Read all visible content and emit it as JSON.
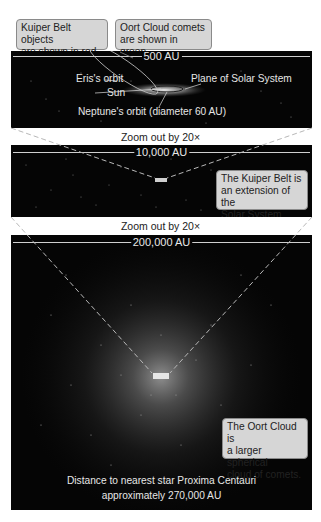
{
  "legend": {
    "kuiper_note": [
      "Kuiper Belt objects",
      "are shown in red."
    ],
    "oort_note": [
      "Oort Cloud comets",
      "are shown in green."
    ]
  },
  "panel1": {
    "scale_label": "500 AU",
    "labels": {
      "eris": "Eris's orbit",
      "plane": "Plane of Solar System",
      "sun": "Sun",
      "neptune": "Neptune's orbit (diameter 60 AU)"
    }
  },
  "zoom_step_1": "Zoom out by 20×",
  "panel2": {
    "scale_label": "10,000 AU",
    "callout": [
      "The Kuiper Belt is",
      "an extension of the",
      "Solar System disk."
    ]
  },
  "zoom_step_2": "Zoom out by 20×",
  "panel3": {
    "scale_label": "200,000 AU",
    "callout": [
      "The Oort Cloud is",
      "a larger spherical",
      "cloud of comets."
    ],
    "footer": [
      "Distance to nearest star Proxima Centauri",
      "approximately 270,000 AU"
    ]
  },
  "colors": {
    "space": "#050505",
    "callout_bg": "#d6d6d6",
    "callout_border": "#8a8a8a",
    "label_text": "#e6e6e6"
  }
}
